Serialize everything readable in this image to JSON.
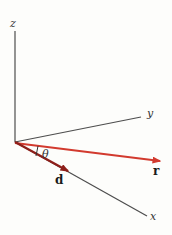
{
  "figure": {
    "background": "#fdfdfb",
    "axis_color": "#4d4d4d",
    "label_color": "#333333",
    "width": "172",
    "height": "235"
  },
  "axes": {
    "z": {
      "label": "z",
      "x1": 15,
      "y1": 31,
      "x2": 15,
      "y2": 142,
      "lx": 10,
      "ly": 27
    },
    "y": {
      "label": "y",
      "x1": 15,
      "y1": 142,
      "x2": 141,
      "y2": 117,
      "lx": 147,
      "ly": 117
    },
    "x": {
      "label": "x",
      "x1": 15,
      "y1": 142,
      "x2": 147,
      "y2": 216,
      "lx": 150,
      "ly": 220
    }
  },
  "vectors": {
    "r": {
      "label": "r",
      "color": "#d23a2e",
      "x1": 15,
      "y1": 143,
      "x2": 160,
      "y2": 161,
      "lx": 153,
      "ly": 175
    },
    "d": {
      "label": "d",
      "color": "#8e1f1a",
      "x1": 15,
      "y1": 142,
      "x2": 68,
      "y2": 171,
      "lx": 55,
      "ly": 184
    }
  },
  "angle": {
    "symbol": "θ",
    "lx": 42,
    "ly": 158,
    "tick": {
      "x1": 38,
      "y1": 146,
      "x2": 36,
      "y2": 156
    }
  }
}
